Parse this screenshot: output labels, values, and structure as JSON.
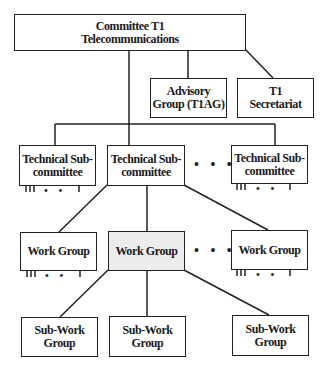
{
  "diagram": {
    "type": "org-chart",
    "top": {
      "label": "Committee T1\nTelecommunications"
    },
    "advisory": {
      "label": "Advisory\nGroup (T1AG)"
    },
    "secretariat": {
      "label": "T1\nSecretariat"
    },
    "technical_subcommittees": [
      {
        "label": "Technical Sub-\ncommittee"
      },
      {
        "label": "Technical Sub-\ncommittee"
      },
      {
        "label": "Technical Sub-\ncommittee"
      }
    ],
    "work_groups": [
      {
        "label": "Work Group"
      },
      {
        "label": "Work Group",
        "highlighted": true
      },
      {
        "label": "Work Group"
      }
    ],
    "sub_work_groups": [
      {
        "label": "Sub-Work\nGroup"
      },
      {
        "label": "Sub-Work\nGroup"
      },
      {
        "label": "Sub-Work\nGroup"
      }
    ],
    "ellipsis": "• • •",
    "small_ellipsis": "• •",
    "highlight_color": "#ececec",
    "line_color": "#222222"
  }
}
